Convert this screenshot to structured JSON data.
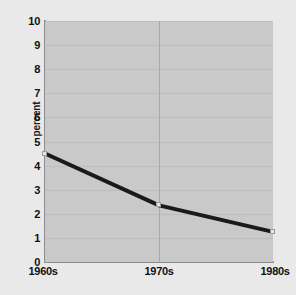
{
  "chart_data": {
    "type": "line",
    "title": "",
    "xlabel": "",
    "ylabel": "percent",
    "categories": [
      "1960s",
      "1970s",
      "1980s"
    ],
    "values": [
      4.5,
      2.35,
      1.25
    ],
    "series": [
      {
        "name": "percent",
        "values": [
          4.5,
          2.35,
          1.25
        ]
      }
    ],
    "ylim": [
      0,
      10
    ],
    "y_ticks": [
      "0",
      "1",
      "2",
      "3",
      "4",
      "5",
      "6",
      "7",
      "8",
      "9",
      "10"
    ],
    "x_ticks": [
      "1960s",
      "1970s",
      "1980s"
    ],
    "grid": true,
    "legend": "none",
    "colors": {
      "line": "#1a1a1a",
      "plot_background": "#c9c9c9",
      "page_background": "#e9e9e9",
      "axis": "#8d8d8d",
      "gridline": "#bdbdbd",
      "text": "#111111",
      "marker_fill": "#e4e4e4"
    }
  },
  "axes": {
    "y_title": "percent",
    "y_labels": [
      "10",
      "9",
      "8",
      "7",
      "6",
      "5",
      "4",
      "3",
      "2",
      "1",
      "0"
    ],
    "x_labels": [
      "1960s",
      "1970s",
      "1980s"
    ]
  }
}
